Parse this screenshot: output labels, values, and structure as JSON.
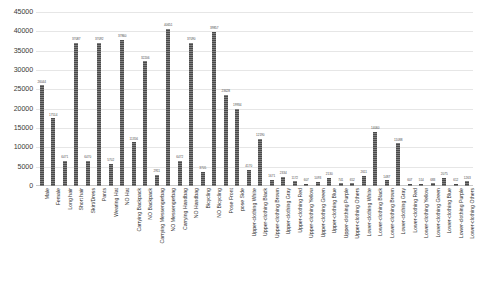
{
  "chart_data": {
    "type": "bar",
    "title": "",
    "xlabel": "",
    "ylabel": "",
    "ylim": [
      0,
      45000
    ],
    "grid": true,
    "legend": null,
    "y_ticks": [
      0,
      5000,
      10000,
      15000,
      20000,
      25000,
      30000,
      35000,
      40000,
      45000
    ],
    "y_tick_labels": [
      "0",
      "5000",
      "10000",
      "15000",
      "20000",
      "25000",
      "30000",
      "35000",
      "40000",
      "45000"
    ],
    "bar_color": "#4a4a4a",
    "categories": [
      "Male",
      "Female",
      "Long hair",
      "Short hair",
      "Skirt/Dress",
      "Pants",
      "Wearing Hat",
      "NO Hat",
      "Carrying Backpack",
      "NO Backpack",
      "Carrying Messengerbag",
      "NO Messengerbag",
      "Carrying Handbag",
      "NO Handbag",
      "Bicycling",
      "NO Bicycling",
      "Pose Front",
      "pose Side",
      "Upper-clothing White",
      "Upper-clothing Black",
      "Upper-clothing Brown",
      "Upper-clothing Gray",
      "Upper-clothing Red",
      "Upper-clothing Yellow",
      "Upper-clothing Green",
      "Upper-clothing Blue",
      "Upper-clothing Purple",
      "Upper-clothing Others",
      "Lower-clothing White",
      "Lower-clothing Black",
      "Lower-clothing Brown",
      "Lower-clothing Gray",
      "Lower-clothing Red",
      "Lower-clothing Yellow",
      "Lower-clothing Green",
      "Lower-clothing Blue",
      "Lower-clothing Purple",
      "Lower-clothing Others"
    ],
    "values": [
      26044,
      17514,
      6471,
      37087,
      6470,
      37092,
      5702,
      37860,
      11356,
      32206,
      2911,
      40651,
      6472,
      37090,
      3705,
      39857,
      23628,
      19934,
      4170,
      12190,
      1671,
      2334,
      1172,
      607,
      1093,
      2130,
      741,
      652,
      2611,
      14060,
      1487,
      11088,
      607,
      514,
      683,
      2075,
      612,
      1263
    ],
    "value_labels": [
      "26044",
      "17514",
      "6471",
      "37087",
      "6470",
      "37092",
      "5702",
      "37860",
      "11356",
      "32206",
      "2911",
      "40651",
      "6472",
      "37090",
      "3705",
      "39857",
      "23628",
      "19934",
      "4170",
      "12190",
      "1671",
      "2334",
      "1172",
      "607",
      "1093",
      "2130",
      "741",
      "652",
      "2611",
      "14060",
      "1487",
      "11088",
      "607",
      "514",
      "683",
      "2075",
      "612",
      "1263"
    ]
  }
}
